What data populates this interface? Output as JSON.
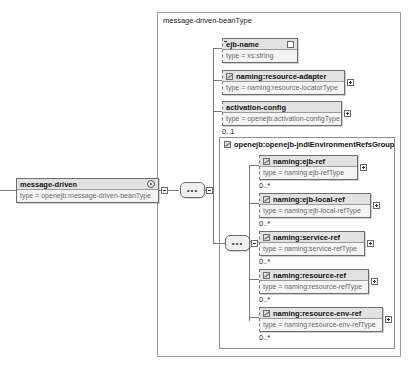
{
  "diagram": {
    "title": "message-driven-beanType",
    "root": {
      "name": "message-driven",
      "type": "type = openejb:message-driven-beanType",
      "glyph": "attributes-circle-icon"
    },
    "group": {
      "name": "openejb:openejb-jndiEnvironmentRefsGroup",
      "glyph": "group-ref-icon"
    },
    "sequence_label": "•••",
    "children": [
      {
        "name": "ejb-name",
        "type": "type = xs:string",
        "cardinality": "",
        "toggle": "collapse",
        "glyph": ""
      },
      {
        "name": "naming:resource-adapter",
        "type": "type = naming:resource-locatorType",
        "cardinality": "",
        "toggle": "expand",
        "glyph": "element-ref-icon"
      },
      {
        "name": "activation-config",
        "type": "type = openejb:activation-configType",
        "cardinality": "0..1",
        "toggle": "expand",
        "glyph": ""
      }
    ],
    "group_children": [
      {
        "name": "naming:ejb-ref",
        "type": "type = naming:ejb-refType",
        "cardinality": "0..*",
        "toggle": "expand",
        "glyph": "element-ref-icon"
      },
      {
        "name": "naming:ejb-local-ref",
        "type": "type = naming:ejb-local-refType",
        "cardinality": "0..*",
        "toggle": "expand",
        "glyph": "element-ref-icon"
      },
      {
        "name": "naming:service-ref",
        "type": "type = naming:service-refType",
        "cardinality": "0..*",
        "toggle": "expand",
        "glyph": "element-ref-icon"
      },
      {
        "name": "naming:resource-ref",
        "type": "type = naming:resource-refType",
        "cardinality": "0..*",
        "toggle": "expand",
        "glyph": "element-ref-icon"
      },
      {
        "name": "naming:resource-env-ref",
        "type": "type = naming:resource-env-refType",
        "cardinality": "0..*",
        "toggle": "expand",
        "glyph": "element-ref-icon"
      }
    ],
    "colors": {
      "box_fill": "#f2f2f2",
      "title_fill": "#e2e2e2",
      "border": "#6e6e6e",
      "type_text": "#6b6b6b",
      "line": "#7a7a7a"
    }
  }
}
